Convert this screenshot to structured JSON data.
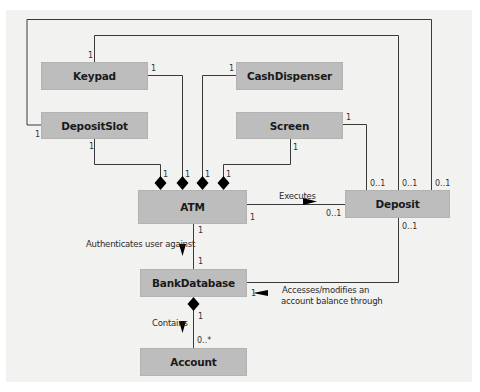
{
  "diagram": {
    "type": "UML class diagram",
    "colors": {
      "class_fill": "#bdbdbd",
      "background": "#f2f2f1",
      "line": "#3a3a3a",
      "diamond": "#000000"
    },
    "classes": {
      "keypad": "Keypad",
      "cash_dispenser": "CashDispenser",
      "deposit_slot": "DepositSlot",
      "screen": "Screen",
      "atm": "ATM",
      "deposit": "Deposit",
      "bank_database": "BankDatabase",
      "account": "Account"
    },
    "associations": {
      "executes": "Executes",
      "authenticates": "Authenticates user against",
      "accesses_line1": "Accesses/modifies an",
      "accesses_line2": "account balance through",
      "contains": "Contains"
    },
    "multiplicities": {
      "keypad_top": "1",
      "keypad_right": "1",
      "cash_left": "1",
      "depositslot_left": "1",
      "depositslot_bottom": "1",
      "screen_bottom": "1",
      "screen_right": "1",
      "atm_d1": "1",
      "atm_d2": "1",
      "atm_d3": "1",
      "atm_d4": "1",
      "atm_right": "1",
      "atm_bottom": "1",
      "deposit_left": "0..1",
      "deposit_top1": "0..1",
      "deposit_top2": "0..1",
      "deposit_top3": "0..1",
      "deposit_bottom": "0..1",
      "bankdb_top": "1",
      "bankdb_right": "1",
      "bankdb_bottom": "1",
      "account_top": "0..*"
    }
  }
}
